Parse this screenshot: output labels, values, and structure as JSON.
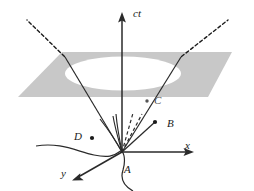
{
  "figure": {
    "background_color": "#ffffff",
    "ink_color": "#1a1a1a",
    "plane_fill_color": "#c8c8c8",
    "cone_interior_color": "#ffffff",
    "width": 254,
    "height": 191
  },
  "axes": [
    {
      "id": "ct",
      "label": "ct",
      "label_x": 133,
      "label_y": 8,
      "direction": "up",
      "arrow": true
    },
    {
      "id": "x",
      "label": "x",
      "label_x": 185,
      "label_y": 140,
      "direction": "right",
      "arrow": true
    },
    {
      "id": "y",
      "label": "y",
      "label_x": 61,
      "label_y": 168,
      "direction": "down-left",
      "arrow": true
    }
  ],
  "events": [
    {
      "id": "A",
      "label": "A",
      "label_x": 124,
      "label_y": 164,
      "point_x": 122,
      "point_y": 152,
      "marker": false,
      "note": "apex of light cone at origin"
    },
    {
      "id": "B",
      "label": "B",
      "label_x": 167,
      "label_y": 118,
      "point_x": 155,
      "point_y": 122,
      "marker": true,
      "note": "event on future light cone"
    },
    {
      "id": "C",
      "label": "C",
      "label_x": 154,
      "label_y": 95,
      "point_x": 147,
      "point_y": 101,
      "marker": true,
      "note": "event on the plane outside the cone"
    },
    {
      "id": "D",
      "label": "D",
      "label_x": 74,
      "label_y": 131,
      "point_x": 92,
      "point_y": 138,
      "marker": true,
      "note": "event outside the cone"
    }
  ],
  "elements": {
    "plane": "gray parallelogram (constant-time slice)",
    "ellipse": "white ellipse where the light cone intersects the plane",
    "cone_edges_dashed": "dashed light-cone edges above the plane",
    "cone_edges_solid": "solid light-cone edges below the plane",
    "worldlines_solid": "solid worldlines fanning from A",
    "worldlines_dashed": "dashed worldlines fanning from A",
    "wavy_worldline": "wavy curve crossing through A"
  }
}
